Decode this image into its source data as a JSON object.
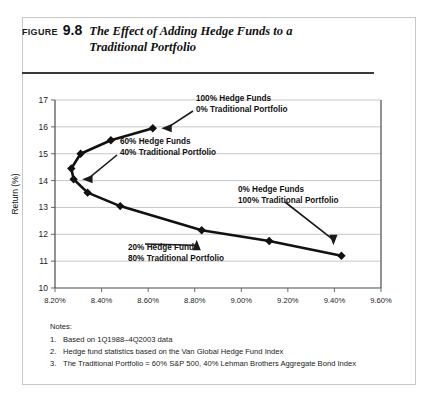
{
  "figure": {
    "label": "FIGURE",
    "number": "9.8",
    "title_line1": "The Effect of Adding Hedge Funds to a",
    "title_line2": "Traditional Portfolio"
  },
  "notes": {
    "heading": "Notes:",
    "items": [
      {
        "num": "1.",
        "text": "Based on 1Q1988–4Q2003 data"
      },
      {
        "num": "2.",
        "text": "Hedge fund statistics based on the Van Global Hedge Fund Index"
      },
      {
        "num": "3.",
        "text": "The Traditional Portfolio = 60% S&P 500, 40% Lehman Brothers Aggregate Bond Index"
      }
    ]
  },
  "chart_data": {
    "type": "line",
    "title": "The Effect of Adding Hedge Funds to a Traditional Portfolio",
    "xlabel": "Standard Deviation",
    "ylabel": "Return (%)",
    "xlim": [
      8.2,
      9.6
    ],
    "ylim": [
      10,
      17
    ],
    "xticks": [
      8.2,
      8.4,
      8.6,
      8.8,
      9.0,
      9.2,
      9.4,
      9.6
    ],
    "xticklabels": [
      "8.20%",
      "8.40%",
      "8.60%",
      "8.80%",
      "9.00%",
      "9.20%",
      "9.40%",
      "9.60%"
    ],
    "yticks": [
      10,
      11,
      12,
      13,
      14,
      15,
      16,
      17
    ],
    "yticklabels": [
      "10",
      "11",
      "12",
      "13",
      "14",
      "15",
      "16",
      "17"
    ],
    "grid": "horizontal",
    "legend": "none",
    "series": [
      {
        "name": "Efficient frontier: hedge funds + traditional portfolio",
        "x": [
          8.62,
          8.44,
          8.31,
          8.27,
          8.28,
          8.34,
          8.48,
          8.83,
          9.12,
          9.43
        ],
        "y": [
          15.95,
          15.5,
          15.0,
          14.45,
          14.05,
          13.55,
          13.05,
          12.15,
          11.75,
          11.2
        ],
        "marker": "diamond",
        "color": "#111111"
      }
    ],
    "annotations": [
      {
        "id": "hedge-100",
        "line1": "100% Hedge Funds",
        "line2": "0% Traditional Portfolio",
        "points_to_x": 8.62,
        "points_to_y": 15.95
      },
      {
        "id": "hedge-60",
        "line1": "60% Hedge Funds",
        "line2": "40% Traditional Portfolio",
        "points_to_x": 8.28,
        "points_to_y": 14.05
      },
      {
        "id": "hedge-20",
        "line1": "20% Hedge Funds",
        "line2": "80% Traditional Portfolio",
        "points_to_x": 8.83,
        "points_to_y": 12.15
      },
      {
        "id": "hedge-0",
        "line1": "0% Hedge Funds",
        "line2": "100% Traditional Portfolio",
        "points_to_x": 9.43,
        "points_to_y": 11.2
      }
    ]
  }
}
